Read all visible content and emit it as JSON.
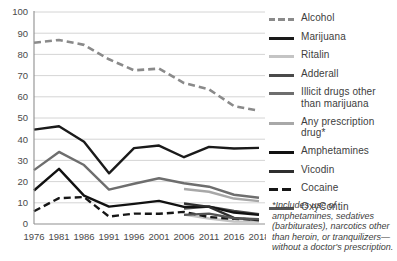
{
  "chart_data": {
    "type": "line",
    "title": "",
    "subtitle": "",
    "xlabel": "",
    "ylabel": "",
    "xlim": [
      1976,
      2018
    ],
    "ylim": [
      0,
      100
    ],
    "yticks": [
      0,
      10,
      20,
      30,
      40,
      50,
      60,
      70,
      80,
      90,
      100
    ],
    "grid": true,
    "legend_position": "right",
    "categories": [
      "1976",
      "1981",
      "1986",
      "1991",
      "1996",
      "2001",
      "2006",
      "2011",
      "2016",
      "2018"
    ],
    "x": [
      1976,
      1981,
      1986,
      1991,
      1996,
      2001,
      2006,
      2011,
      2016,
      2018
    ],
    "series": [
      {
        "name": "Alcohol",
        "color": "#8a8a8a",
        "style": "dashed",
        "width": 2.6,
        "values": [
          85.5,
          86.8,
          84.5,
          77.7,
          72.5,
          73.3,
          66.5,
          63.5,
          55.6,
          53.4
        ]
      },
      {
        "name": "Marijuana",
        "color": "#1a1a1a",
        "style": "solid",
        "width": 2.4,
        "values": [
          44.5,
          46.1,
          38.8,
          23.9,
          35.8,
          37.0,
          31.5,
          36.4,
          35.6,
          35.9
        ]
      },
      {
        "name": "Ritalin",
        "color": "#c4c4c4",
        "style": "solid",
        "width": 2.4,
        "values": [
          null,
          null,
          null,
          null,
          null,
          null,
          4.4,
          2.6,
          1.2,
          1.1
        ]
      },
      {
        "name": "Adderall",
        "color": "#4a4a4a",
        "style": "solid",
        "width": 2.4,
        "values": [
          null,
          null,
          null,
          null,
          null,
          null,
          7.3,
          8.2,
          6.2,
          4.6
        ]
      },
      {
        "name": "Illicit drugs other than marijuana",
        "color": "#6e6e6e",
        "style": "solid",
        "width": 2.4,
        "values": [
          25.4,
          34.0,
          27.8,
          16.2,
          19.0,
          21.6,
          19.2,
          17.6,
          13.8,
          12.4
        ]
      },
      {
        "name": "Any prescription drug*",
        "color": "#a8a8a8",
        "style": "solid",
        "width": 2.4,
        "values": [
          null,
          null,
          null,
          null,
          null,
          null,
          16.5,
          15.2,
          12.0,
          10.8
        ]
      },
      {
        "name": "Amphetamines",
        "color": "#111111",
        "style": "solid",
        "width": 2.4,
        "values": [
          15.8,
          26.0,
          13.4,
          8.2,
          9.5,
          10.9,
          8.1,
          8.2,
          5.4,
          4.3
        ]
      },
      {
        "name": "Vicodin",
        "color": "#2e2e2e",
        "style": "solid",
        "width": 2.4,
        "values": [
          null,
          null,
          null,
          null,
          null,
          null,
          9.7,
          8.1,
          2.9,
          1.7
        ]
      },
      {
        "name": "Cocaine",
        "color": "#161616",
        "style": "dashed",
        "width": 2.4,
        "values": [
          6.0,
          12.2,
          12.7,
          3.5,
          4.9,
          4.8,
          5.7,
          3.3,
          2.4,
          2.2
        ]
      },
      {
        "name": "OxyContin",
        "color": "#555555",
        "style": "solid",
        "width": 2.4,
        "values": [
          null,
          null,
          null,
          null,
          null,
          null,
          4.3,
          4.9,
          2.7,
          2.3
        ]
      }
    ],
    "footnote": "*Includes use of amphetamines, sedatives (barbiturates), narcotics other than heroin, or tranquilizers—without a doctor's prescription."
  },
  "legend": {
    "items": [
      {
        "label": "Alcohol"
      },
      {
        "label": "Marijuana"
      },
      {
        "label": "Ritalin"
      },
      {
        "label": "Adderall"
      },
      {
        "label": "Illicit drugs other than marijuana"
      },
      {
        "label": "Any prescription drug*"
      },
      {
        "label": "Amphetamines"
      },
      {
        "label": "Vicodin"
      },
      {
        "label": "Cocaine"
      },
      {
        "label": "OxyContin"
      }
    ]
  },
  "footnote": {
    "text": "*Includes use of amphetamines, sedatives (barbiturates), narcotics other than heroin, or tranquilizers—without a doctor's prescription."
  }
}
